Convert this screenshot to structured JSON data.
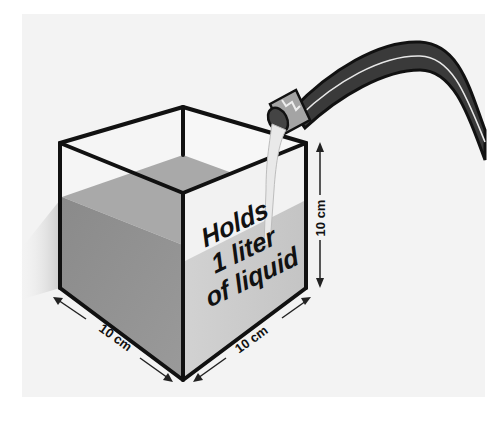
{
  "diagram": {
    "container_label": {
      "line1": "Holds",
      "line2": "1 liter",
      "line3": "of liquid"
    },
    "dimensions": {
      "width_label": "10 cm",
      "depth_label": "10 cm",
      "height_label": "10 cm"
    },
    "objects": {
      "container": "cube-container",
      "source": "garden-hose",
      "stream": "liquid-stream"
    },
    "colors": {
      "background_panel": "#f3f3f3",
      "outline": "#111111",
      "liquid_top": "#a9a9a9",
      "liquid_left_face": "#8e8e8e",
      "liquid_right_face": "#c9c9c9",
      "empty_face": "#f4f4f4",
      "hose": "#3b3b3b",
      "hose_highlight": "#e6e6e6",
      "nozzle": "#9a9a9a"
    }
  }
}
